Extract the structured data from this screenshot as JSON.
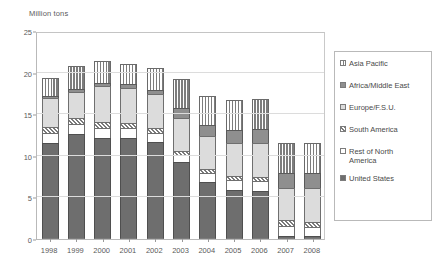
{
  "chart_data": {
    "type": "bar",
    "subtype": "stacked-vertical",
    "title": "",
    "unit_label": "Million tons",
    "xlabel": "",
    "ylabel": "Million tons",
    "ylim": [
      0,
      25
    ],
    "yticks": [
      0,
      5,
      10,
      15,
      20,
      25
    ],
    "grid": true,
    "legend_position": "right",
    "categories": [
      "1998",
      "1999",
      "2000",
      "2001",
      "2002",
      "2003",
      "2004",
      "2005",
      "2006",
      "2007",
      "2008"
    ],
    "series": [
      {
        "name": "United States",
        "swatch": "solid-dark-gray",
        "color": "#6e6e6e",
        "values": [
          11.5,
          12.6,
          12.2,
          12.1,
          11.7,
          9.2,
          6.8,
          5.9,
          5.8,
          0.4,
          0.4
        ]
      },
      {
        "name": "Rest of North America",
        "swatch": "solid-white",
        "color": "#ffffff",
        "values": [
          1.3,
          1.2,
          1.2,
          1.2,
          1.1,
          0.9,
          1.1,
          1.2,
          1.2,
          1.2,
          1.1
        ]
      },
      {
        "name": "South America",
        "swatch": "diagonal-hatch",
        "color": "#ffffff",
        "values": [
          0.7,
          0.8,
          0.7,
          0.7,
          0.6,
          0.5,
          0.5,
          0.5,
          0.5,
          0.7,
          0.6
        ]
      },
      {
        "name": "Europe/F.S.U.",
        "swatch": "solid-light-gray",
        "color": "#dcdcdc",
        "values": [
          3.4,
          3.1,
          4.3,
          4.2,
          4.0,
          4.0,
          4.0,
          4.0,
          4.1,
          3.8,
          4.0
        ]
      },
      {
        "name": "Africa/Middle East",
        "swatch": "solid-mid-gray",
        "color": "#8f8f8f",
        "values": [
          0.3,
          0.3,
          0.4,
          0.4,
          0.5,
          1.1,
          1.3,
          1.5,
          1.6,
          1.8,
          1.8
        ]
      },
      {
        "name": "Asia Pacific",
        "swatch": "vertical-stripe",
        "color": "#ffffff",
        "values": [
          2.1,
          2.8,
          2.6,
          2.4,
          2.6,
          3.5,
          3.5,
          3.6,
          3.6,
          3.7,
          3.6
        ]
      }
    ],
    "totals": [
      19.3,
      20.8,
      21.4,
      21.0,
      20.5,
      19.2,
      17.2,
      16.7,
      16.8,
      11.6,
      11.5
    ]
  },
  "legend": {
    "items": [
      {
        "label": "Asia Pacific",
        "pattern": "vertical-stripe"
      },
      {
        "label": "Africa/Middle East",
        "pattern": "solid-mid-gray"
      },
      {
        "label": "Europe/F.S.U.",
        "pattern": "solid-light-gray"
      },
      {
        "label": "South America",
        "pattern": "diagonal-hatch"
      },
      {
        "label": "Rest of North\nAmerica",
        "pattern": "solid-white"
      },
      {
        "label": "United States",
        "pattern": "solid-dark-gray"
      }
    ]
  },
  "colors": {
    "united_states": "#6e6e6e",
    "rest_of_north_america": "#ffffff",
    "south_america": "#ffffff",
    "europe_fsu": "#dcdcdc",
    "africa_middle_east": "#8f8f8f",
    "asia_pacific": "#ffffff",
    "axis": "#9a9a9a",
    "grid": "#dcdcdc",
    "text": "#4a4a4a"
  }
}
